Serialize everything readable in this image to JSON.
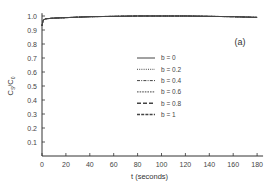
{
  "chart_data": {
    "type": "line",
    "title": "",
    "panel_label": "(a)",
    "xlabel": "t (seconds)",
    "ylabel": "C_s/C_0",
    "xlim": [
      0,
      185
    ],
    "ylim": [
      0,
      1.0
    ],
    "xticks": [
      0,
      20,
      40,
      60,
      80,
      100,
      120,
      140,
      160,
      180
    ],
    "yticks": [
      0.1,
      0.2,
      0.3,
      0.4,
      0.5,
      0.6,
      0.7,
      0.8,
      0.9,
      1.0
    ],
    "ytick_labels": [
      "0.1",
      "0.2",
      "0.3",
      "0.4",
      "0.5",
      "0.6",
      "0.7",
      "0.8",
      "0.9",
      "1.0"
    ],
    "grid": false,
    "legend_position": "center-right",
    "series": [
      {
        "name": "b = 0",
        "dash": "solid",
        "x": [
          0,
          1,
          3,
          10,
          40,
          80,
          120,
          160,
          180
        ],
        "y": [
          0.93,
          0.97,
          0.98,
          0.985,
          0.995,
          1.0,
          1.0,
          0.995,
          0.99
        ]
      },
      {
        "name": "b = 0.2",
        "dash": "dotted",
        "x": [
          0,
          1,
          3,
          10,
          40,
          80,
          120,
          160,
          180
        ],
        "y": [
          0.93,
          0.97,
          0.98,
          0.985,
          0.995,
          1.0,
          1.0,
          0.995,
          0.99
        ]
      },
      {
        "name": "b = 0.4",
        "dash": "dashdot",
        "x": [
          0,
          1,
          3,
          10,
          40,
          80,
          120,
          160,
          180
        ],
        "y": [
          0.93,
          0.97,
          0.98,
          0.985,
          0.995,
          1.0,
          1.0,
          0.995,
          0.99
        ]
      },
      {
        "name": "b = 0.6",
        "dash": "shortdash",
        "x": [
          0,
          1,
          3,
          10,
          40,
          80,
          120,
          160,
          180
        ],
        "y": [
          0.93,
          0.97,
          0.98,
          0.985,
          0.995,
          1.0,
          1.0,
          0.995,
          0.99
        ]
      },
      {
        "name": "b = 0.8",
        "dash": "longdash",
        "x": [
          0,
          1,
          3,
          10,
          40,
          80,
          120,
          160,
          180
        ],
        "y": [
          0.93,
          0.97,
          0.98,
          0.985,
          0.995,
          1.0,
          1.0,
          0.995,
          0.99
        ]
      },
      {
        "name": "b = 1",
        "dash": "dashed",
        "x": [
          0,
          1,
          3,
          10,
          40,
          80,
          120,
          160,
          180
        ],
        "y": [
          0.93,
          0.97,
          0.98,
          0.985,
          0.995,
          1.0,
          1.0,
          0.995,
          0.99
        ]
      }
    ]
  },
  "style": {
    "axis_color": "#333333",
    "line_color": "#444444"
  }
}
